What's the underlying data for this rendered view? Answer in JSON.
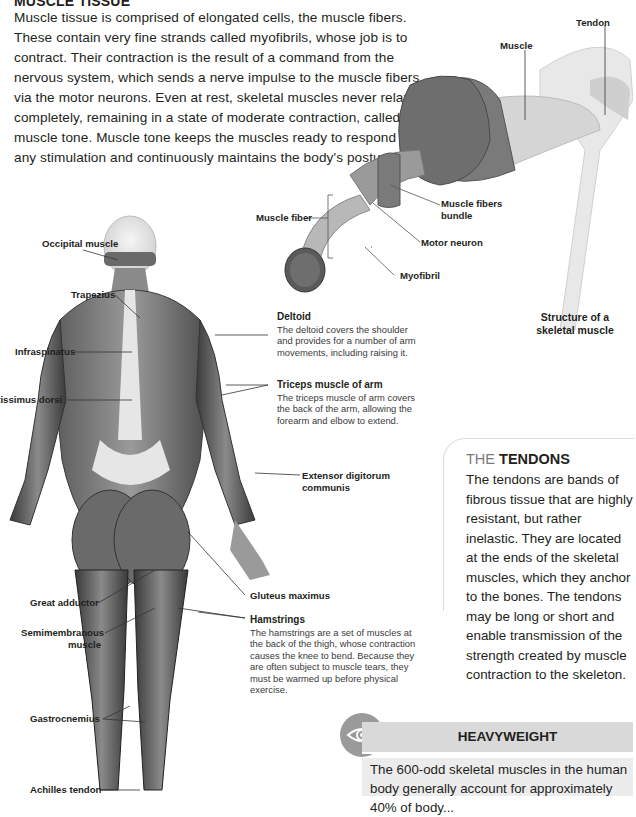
{
  "muscle_tissue": {
    "heading": "MUSCLE TISSUE",
    "body": "Muscle tissue is comprised of elongated cells, the muscle fibers. These contain very fine strands called myofibrils, whose job is to contract. Their contraction is the result of a command from the nervous system, which sends a nerve impulse to the muscle fibers via the motor neurons. Even at rest, skeletal muscles never relax completely, remaining in a state of moderate contraction, called muscle tone. Muscle tone keeps the muscles ready to respond to any stimulation and continuously maintains the body's posture."
  },
  "skeletal_structure": {
    "labels": {
      "tendon": "Tendon",
      "muscle": "Muscle",
      "muscle_fiber": "Muscle fiber",
      "muscle_fibers_bundle_1": "Muscle fibers",
      "muscle_fibers_bundle_2": "bundle",
      "motor_neuron": "Motor neuron",
      "myofibril": "Myofibril"
    },
    "caption_line1": "Structure of a",
    "caption_line2": "skeletal muscle"
  },
  "body_labels": {
    "occipital": "Occipital muscle",
    "trapezius": "Trapezius",
    "infraspinatus": "Infraspinatus",
    "latissimus": "Latissimus dorsi",
    "extensor_1": "Extensor digitorum",
    "extensor_2": "communis",
    "gluteus": "Gluteus maximus",
    "great_adductor": "Great adductor",
    "semimembranous_1": "Semimembranous",
    "semimembranous_2": "muscle",
    "gastrocnemius": "Gastrocnemius",
    "achilles": "Achilles tendon"
  },
  "descriptions": {
    "deltoid": {
      "title": "Deltoid",
      "text": "The deltoid covers the shoulder and provides for a number of arm movements, including raising it."
    },
    "triceps": {
      "title": "Triceps muscle of arm",
      "text": "The triceps muscle of arm covers the back of the arm, allowing the forearm and elbow to extend."
    },
    "hamstrings": {
      "title": "Hamstrings",
      "text": "The hamstrings are a set of muscles at the back of the thigh, whose contraction causes the knee to bend. Because they are often subject to muscle tears, they must be warmed up before physical exercise."
    }
  },
  "tendons_box": {
    "title_prefix": "THE ",
    "title_bold": "TENDONS",
    "body": "The tendons are bands of fibrous tissue that are highly resistant, but rather inelastic. They are located at the ends of the skeletal muscles, which they anchor to the bones. The tendons may be long or short and enable transmission of the strength created by muscle contraction to the skeleton."
  },
  "heavyweight_box": {
    "icon": "eye-icon",
    "title": "HEAVYWEIGHT",
    "body": "The 600-odd skeletal muscles in the human body generally account for approximately 40% of body..."
  }
}
